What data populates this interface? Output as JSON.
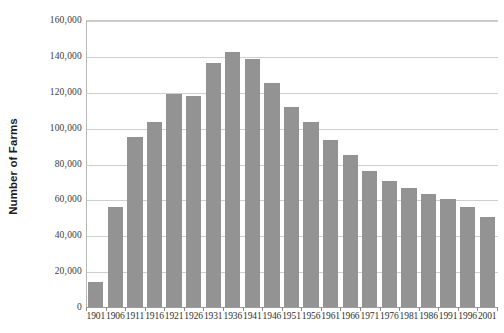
{
  "chart_data": {
    "type": "bar",
    "title": "",
    "xlabel": "",
    "ylabel": "Number of Farms",
    "categories": [
      "1901",
      "1906",
      "1911",
      "1916",
      "1921",
      "1926",
      "1931",
      "1936",
      "1941",
      "1946",
      "1951",
      "1956",
      "1961",
      "1966",
      "1971",
      "1976",
      "1981",
      "1986",
      "1991",
      "1996",
      "2001"
    ],
    "values": [
      14000,
      56000,
      95000,
      103000,
      119000,
      117500,
      136000,
      142000,
      138500,
      125000,
      111500,
      103000,
      93000,
      85000,
      76000,
      70000,
      66500,
      63000,
      60000,
      56000,
      50000
    ],
    "ylim": [
      0,
      160000
    ],
    "ytick_labels": [
      "160,000",
      "140,000",
      "120,000",
      "100,000",
      "80,000",
      "60,000",
      "40,000",
      "20,000",
      "0"
    ],
    "ytick_values": [
      160000,
      140000,
      120000,
      100000,
      80000,
      60000,
      40000,
      20000,
      0
    ],
    "grid": true,
    "legend": "none",
    "bar_color": "#939393",
    "grid_color": "#cfcfcf",
    "axis_color": "#9d9d9d"
  }
}
